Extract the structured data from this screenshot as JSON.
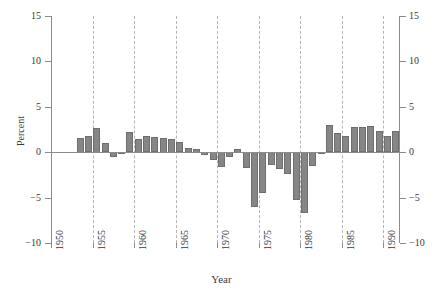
{
  "chart_data": {
    "type": "bar",
    "title": "",
    "subtitle": "",
    "xlabel": "Year",
    "ylabel": "Percent",
    "xlim": [
      1950,
      1992
    ],
    "ylim": [
      -10,
      15
    ],
    "yticks": [
      15,
      10,
      5,
      0,
      -5,
      -10
    ],
    "ytick_labels_left": [
      "15",
      "10",
      "5",
      "0",
      "−5",
      "−10"
    ],
    "ytick_labels_right": [
      "15",
      "10",
      "5",
      "0",
      "−5",
      "−10"
    ],
    "xticks": [
      1950,
      1955,
      1960,
      1965,
      1970,
      1975,
      1980,
      1985,
      1990
    ],
    "xtick_labels": [
      "1950",
      "1955",
      "1960",
      "1965",
      "1970",
      "1975",
      "1980",
      "1985",
      "1990"
    ],
    "grid": "vertical-dashed-at-xticks",
    "legend": "none",
    "bar_color": "#868686",
    "bar_edge_color": "#6e6e6e",
    "axis_color": "#8c8c8c",
    "gridline_color": "#b4b4b4",
    "background_color": "#ffffff",
    "categories": [
      1953,
      1954,
      1955,
      1956,
      1957,
      1958,
      1959,
      1960,
      1961,
      1962,
      1963,
      1964,
      1965,
      1966,
      1967,
      1968,
      1969,
      1970,
      1971,
      1972,
      1973,
      1974,
      1975,
      1976,
      1977,
      1978,
      1979,
      1980,
      1981,
      1982,
      1983,
      1984,
      1985,
      1986,
      1987,
      1988,
      1989,
      1990,
      1991
    ],
    "values": [
      1.6,
      1.8,
      2.7,
      1.0,
      -0.6,
      0.0,
      2.2,
      1.5,
      1.8,
      1.7,
      1.6,
      1.5,
      1.1,
      0.5,
      0.4,
      -0.3,
      -0.9,
      -1.7,
      -0.5,
      0.4,
      -1.8,
      -6.1,
      -4.5,
      -1.4,
      -1.9,
      -2.4,
      -5.3,
      -6.7,
      -1.5,
      0.0,
      3.0,
      2.1,
      1.8,
      2.8,
      2.8,
      2.9,
      2.3,
      1.8,
      2.3
    ]
  },
  "axes": {
    "y_title": "Percent",
    "x_title": "Year"
  }
}
